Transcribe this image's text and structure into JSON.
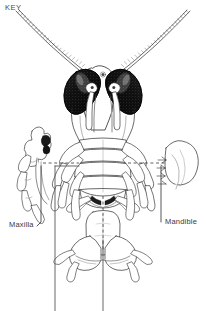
{
  "figure": {
    "title_label": "KEY",
    "caption": "",
    "view": "ventral view of arthropod head and mouthparts",
    "line_color": "#2b2b2b",
    "fill_color": "#ffffff",
    "eye_color": "#111111",
    "text_color": "#3a3a3a",
    "background": "#ffffff",
    "width": 206,
    "height": 311
  },
  "labels": [
    {
      "id": "key",
      "text": "KEY",
      "x": 5,
      "y": 3
    },
    {
      "id": "maxilla",
      "text": "Maxilla",
      "x": 9,
      "y": 220
    },
    {
      "id": "mandible",
      "text": "Mandible",
      "x": 165,
      "y": 217
    }
  ],
  "annotations": {
    "leader_lines": 2,
    "dashed_guides": 3,
    "brackets": 2
  },
  "structures": {
    "antennae": 2,
    "compound_eyes": 2,
    "antennules": 2,
    "appendage_pairs": 5,
    "insets": 2
  }
}
